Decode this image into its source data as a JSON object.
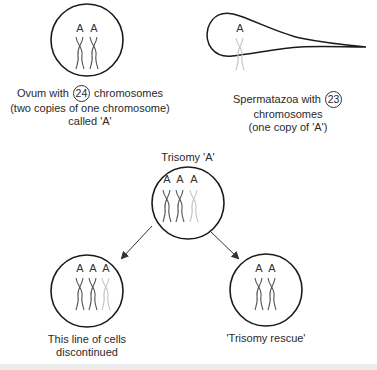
{
  "ovum": {
    "caption_pre": "Ovum with",
    "count": "24",
    "caption_post": "chromosomes",
    "caption_line2": "(two copies of one chromosome)",
    "caption_line3": "called 'A'",
    "chromosome_labels": [
      "A",
      "A"
    ]
  },
  "sperm": {
    "caption_pre": "Spermatazoa with",
    "count": "23",
    "caption_line2": "chromosomes",
    "caption_line3": "(one copy of 'A')",
    "chromosome_labels": [
      "A"
    ]
  },
  "trisomy": {
    "title": "Trisomy 'A'",
    "chromosome_labels": [
      "A",
      "A",
      "A"
    ]
  },
  "discontinued": {
    "caption_line1": "This line of cells",
    "caption_line2": "discontinued",
    "chromosome_labels": [
      "A",
      "A",
      "A"
    ]
  },
  "rescue": {
    "caption": "'Trisomy rescue'",
    "chromosome_labels": [
      "A",
      "A"
    ]
  },
  "colors": {
    "outline": "#1a1a1a",
    "chromosome_dark": "#555555",
    "chromosome_light": "#bbbbbb",
    "arrow": "#333333"
  }
}
